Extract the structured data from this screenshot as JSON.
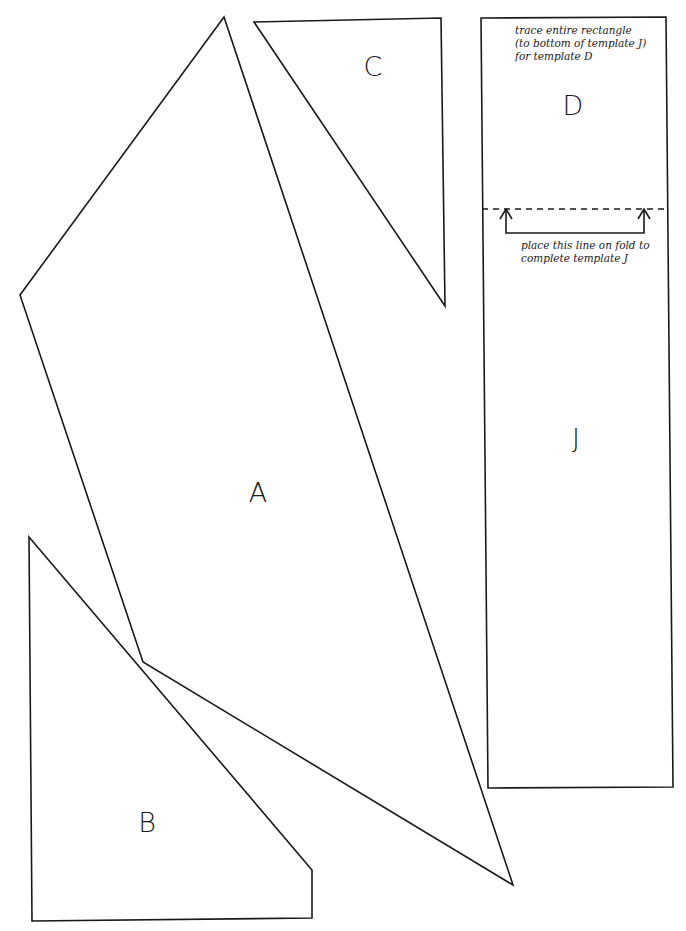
{
  "diagram": {
    "type": "sewing-pattern-templates",
    "stroke_color": "#1a1a1a",
    "background": "#ffffff",
    "pieces": [
      {
        "id": "A",
        "label": "A",
        "shape": "quadrilateral",
        "points": [
          [
            224,
            17
          ],
          [
            513,
            885
          ],
          [
            143,
            662
          ],
          [
            20,
            295
          ]
        ],
        "label_pos": [
          258,
          492
        ]
      },
      {
        "id": "B",
        "label": "B",
        "shape": "pentagon",
        "points": [
          [
            29,
            537
          ],
          [
            312,
            870
          ],
          [
            312,
            918
          ],
          [
            32,
            921
          ]
        ],
        "label_pos": [
          147,
          822
        ]
      },
      {
        "id": "C",
        "label": "C",
        "shape": "triangle",
        "points": [
          [
            254,
            22
          ],
          [
            441,
            18
          ],
          [
            445,
            306
          ]
        ],
        "label_pos": [
          373,
          66
        ]
      },
      {
        "id": "D-J",
        "label_top": "D",
        "label_bottom": "J",
        "shape": "rectangle",
        "points": [
          [
            481,
            18
          ],
          [
            666,
            17
          ],
          [
            673,
            787
          ],
          [
            488,
            788
          ]
        ],
        "label_top_pos": [
          573,
          105
        ],
        "label_bottom_pos": [
          576,
          438
        ]
      }
    ],
    "fold_line": {
      "y": 209,
      "x1": 482,
      "x2": 667,
      "style": "dashed"
    },
    "fold_bracket": {
      "left_x": 506,
      "right_x": 644,
      "top_y": 209,
      "bottom_y": 233
    },
    "notes": {
      "trace": {
        "lines": [
          "trace entire rectangle",
          "(to bottom of template J)",
          "for template D"
        ],
        "pos": [
          515,
          24
        ]
      },
      "fold": {
        "lines": [
          "place this line on fold to",
          "complete template J"
        ],
        "pos": [
          521,
          239
        ]
      }
    }
  }
}
